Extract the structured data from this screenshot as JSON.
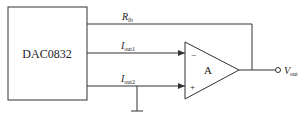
{
  "diagram": {
    "type": "circuit",
    "blocks": [
      {
        "id": "dac",
        "label": "DAC0832"
      },
      {
        "id": "opamp",
        "label": "A",
        "inputs": {
          "inverting": "−",
          "non_inverting": "+"
        }
      }
    ],
    "signals": {
      "rfb": {
        "main": "R",
        "sub": "fb"
      },
      "iout1": {
        "main": "I",
        "sub": "out1"
      },
      "iout2": {
        "main": "I",
        "sub": "out2"
      },
      "vout": {
        "main": "V",
        "sub": "out"
      }
    },
    "connections": [
      {
        "from": "dac.Rfb",
        "to": "opamp.output",
        "label": "Rfb feedback"
      },
      {
        "from": "dac.Iout1",
        "to": "opamp.inverting"
      },
      {
        "from": "dac.Iout2",
        "to": "opamp.non_inverting"
      },
      {
        "from": "dac.Iout2",
        "to": "ground"
      },
      {
        "from": "opamp.output",
        "to": "Vout terminal"
      }
    ]
  }
}
